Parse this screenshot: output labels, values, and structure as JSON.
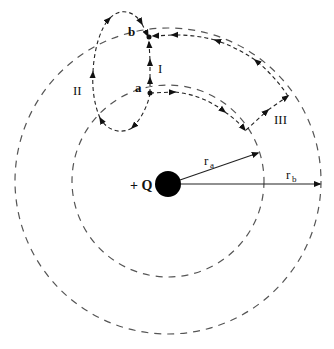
{
  "diagram": {
    "type": "electrostatic-paths",
    "charge": {
      "label": "+ Q",
      "cx": 168,
      "cy": 184,
      "r": 13
    },
    "circles": [
      {
        "name": "r_a",
        "cx": 168,
        "cy": 181,
        "r": 96
      },
      {
        "name": "r_b",
        "cx": 168,
        "cy": 181,
        "r": 153
      }
    ],
    "radius_labels": {
      "ra_main": "r",
      "ra_sub": "a",
      "rb_main": "r",
      "rb_sub": "b"
    },
    "points": {
      "a": "a",
      "b": "b"
    },
    "paths": {
      "I": "I",
      "II": "II",
      "III": "III"
    },
    "colors": {
      "line": "#222222",
      "dash": "#555555",
      "charge": "#000000"
    }
  }
}
